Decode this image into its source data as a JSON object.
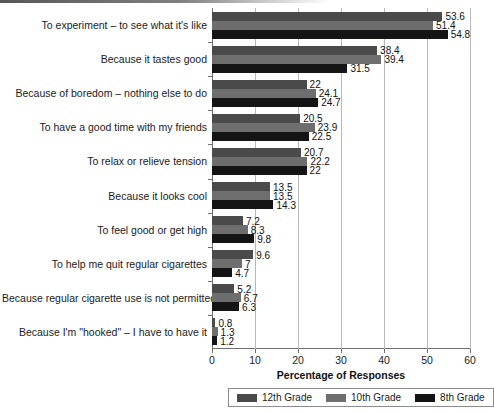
{
  "chart_data": {
    "type": "bar",
    "orientation": "horizontal",
    "title": "",
    "xlabel": "Percentage of Responses",
    "ylabel": "",
    "xlim": [
      0,
      60
    ],
    "xticks": [
      0,
      10,
      20,
      30,
      40,
      50,
      60
    ],
    "grid": true,
    "legend_position": "bottom",
    "categories": [
      "To experiment – to see what it's like",
      "Because it tastes good",
      "Because of boredom – nothing else to do",
      "To have a good time with my friends",
      "To relax or relieve tension",
      "Because it looks cool",
      "To feel good or get high",
      "To help me quit regular cigarettes",
      "Because regular cigarette use is not permitted",
      "Because I'm \"hooked\" – I have to have it"
    ],
    "series": [
      {
        "name": "12th Grade",
        "color": "#4a4a4a",
        "values": [
          53.6,
          38.4,
          22,
          20.5,
          20.7,
          13.5,
          7.2,
          9.6,
          5.2,
          0.8
        ],
        "labels": [
          "53.6",
          "38.4",
          "22",
          "20.5",
          "20.7",
          "13.5",
          "7.2",
          "9.6",
          "5.2",
          "0.8"
        ]
      },
      {
        "name": "10th Grade",
        "color": "#6e6e6e",
        "values": [
          51.4,
          39.4,
          24.1,
          23.9,
          22.2,
          13.5,
          8.3,
          7,
          6.7,
          1.3
        ],
        "labels": [
          "51.4",
          "39.4",
          "24.1",
          "23.9",
          "22.2",
          "13.5",
          "8.3",
          "7",
          "6.7",
          "1.3"
        ]
      },
      {
        "name": "8th Grade",
        "color": "#141414",
        "values": [
          54.8,
          31.5,
          24.7,
          22.5,
          22,
          14.3,
          9.8,
          4.7,
          6.3,
          1.2
        ],
        "labels": [
          "54.8",
          "31.5",
          "24.7",
          "22.5",
          "22",
          "14.3",
          "9.8",
          "4.7",
          "6.3",
          "1.2"
        ]
      }
    ]
  }
}
